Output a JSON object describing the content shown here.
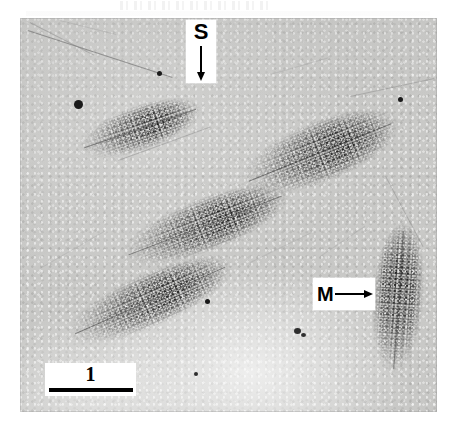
{
  "figure": {
    "type": "electron-micrograph",
    "plate": {
      "left": 20,
      "top": 18,
      "width": 417,
      "height": 394,
      "background_color": "#c8c8c6"
    }
  },
  "annotations": {
    "spacer": {
      "label": "S",
      "icon": "arrow-down-icon",
      "arrow_direction": "down",
      "box_color": "#ffffff",
      "ink_color": "#000000",
      "x": 186,
      "y": 20,
      "width": 30,
      "height": 63
    },
    "matrix": {
      "label": "M",
      "icon": "arrow-right-icon",
      "arrow_direction": "right",
      "box_color": "#ffffff",
      "ink_color": "#000000",
      "x": 313,
      "y": 278,
      "width": 62,
      "height": 32
    }
  },
  "scale_bar": {
    "label": "1",
    "box_color": "#ffffff",
    "bar_color": "#000000",
    "x": 45,
    "y": 363,
    "width": 91,
    "height": 33,
    "bar_length_px": 84
  },
  "transcription_units": [
    {
      "name": "unit-upper-left",
      "cx": 140,
      "cy": 128,
      "w": 128,
      "h": 44,
      "rot": -19,
      "taper": "horizontal"
    },
    {
      "name": "unit-upper-right",
      "cx": 320,
      "cy": 152,
      "w": 168,
      "h": 60,
      "rot": -22,
      "taper": "horizontal"
    },
    {
      "name": "unit-middle",
      "cx": 205,
      "cy": 225,
      "w": 178,
      "h": 52,
      "rot": -21,
      "taper": "horizontal"
    },
    {
      "name": "unit-lower-left",
      "cx": 150,
      "cy": 300,
      "w": 178,
      "h": 52,
      "rot": -24,
      "taper": "horizontal"
    },
    {
      "name": "unit-right-vertical",
      "cx": 398,
      "cy": 300,
      "w": 52,
      "h": 150,
      "rot": 4,
      "taper": "vertical"
    }
  ],
  "spacer_strands": [
    {
      "name": "strand-top-left-long",
      "x": 28,
      "y": 30,
      "len": 150,
      "rot": 18
    },
    {
      "name": "strand-top-left-short",
      "x": 30,
      "y": 22,
      "len": 70,
      "rot": 26
    },
    {
      "name": "strand-mid-diagonal",
      "x": 118,
      "y": 160,
      "len": 96,
      "rot": -20
    },
    {
      "name": "strand-right-upper",
      "x": 352,
      "y": 96,
      "len": 84,
      "rot": -12
    },
    {
      "name": "strand-right-lower",
      "x": 388,
      "y": 176,
      "len": 78,
      "rot": 62
    },
    {
      "name": "strand-lower-mid",
      "x": 250,
      "y": 262,
      "len": 66,
      "rot": -26
    },
    {
      "name": "strand-lower-left",
      "x": 40,
      "y": 268,
      "len": 72,
      "rot": -30
    }
  ],
  "granules": [
    {
      "name": "granule-large-left",
      "x": 74,
      "y": 100,
      "d": 9
    },
    {
      "name": "granule-top-mid",
      "x": 157,
      "y": 71,
      "d": 5
    },
    {
      "name": "granule-right-upper",
      "x": 398,
      "y": 97,
      "d": 5
    },
    {
      "name": "granule-center",
      "x": 205,
      "y": 299,
      "d": 5
    },
    {
      "name": "granule-lower-mid",
      "x": 296,
      "y": 330,
      "d": 6
    },
    {
      "name": "granule-lower-small",
      "x": 195,
      "y": 372,
      "d": 4
    }
  ]
}
